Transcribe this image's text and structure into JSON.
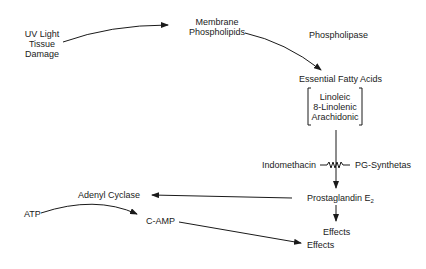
{
  "diagram": {
    "type": "biochemical-pathway",
    "nodes": {
      "trigger": {
        "line1": "UV Light",
        "line2": "Tissue",
        "line3": "Damage"
      },
      "membrane": {
        "line1": "Membrane",
        "line2": "Phospholipids"
      },
      "phospholipase": "Phospholipase",
      "efa": "Essential Fatty Acids",
      "efa_list": [
        "Linoleic",
        "8-Linolenic",
        "Arachidonic"
      ],
      "indomethacin": "Indomethacin",
      "pg_synthetas": "PG-Synthetas",
      "prostaglandin": "Prostaglandin E",
      "prostaglandin_sub": "2",
      "effects_1": "Effects",
      "adenyl_cyclase": "Adenyl Cyclase",
      "atp": "ATP",
      "camp": "C-AMP",
      "effects_2": "Effects"
    },
    "edges": [
      {
        "from": "UV Light Tissue Damage",
        "to": "Membrane Phospholipids"
      },
      {
        "from": "Membrane Phospholipids",
        "to": "Essential Fatty Acids",
        "label": "Phospholipase"
      },
      {
        "from": "Essential Fatty Acids",
        "to": "Prostaglandin E2",
        "label": "PG-Synthetas",
        "inhibitor": "Indomethacin"
      },
      {
        "from": "Prostaglandin E2",
        "to": "Effects"
      },
      {
        "from": "Prostaglandin E2",
        "to": "Adenyl Cyclase"
      },
      {
        "from": "ATP",
        "to": "C-AMP"
      },
      {
        "from": "C-AMP",
        "to": "Effects"
      }
    ]
  }
}
